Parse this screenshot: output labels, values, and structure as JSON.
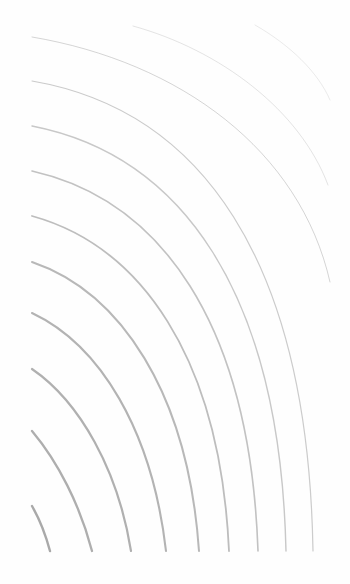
{
  "artwork": {
    "description": "Nested concentric curved lines radiating from the bottom-left corner",
    "background": "#fefefe",
    "line_color": "#9a9a9a",
    "curves": [
      {
        "d": "M32,506 C40,520 46,536 50,551",
        "width": 2.4,
        "opacity": 0.85
      },
      {
        "d": "M32,431 C58,462 80,505 92,551",
        "width": 2.3,
        "opacity": 0.8
      },
      {
        "d": "M32,369 C80,402 118,470 131,551",
        "width": 2.2,
        "opacity": 0.78
      },
      {
        "d": "M32,313 C100,345 152,430 166,551",
        "width": 2.1,
        "opacity": 0.75
      },
      {
        "d": "M32,262 C120,292 188,392 199,551",
        "width": 2.0,
        "opacity": 0.7
      },
      {
        "d": "M32,216 C140,246 220,356 229,551",
        "width": 1.8,
        "opacity": 0.65
      },
      {
        "d": "M32,171 C160,200 250,322 258,551",
        "width": 1.6,
        "opacity": 0.6
      },
      {
        "d": "M32,126 C180,155 280,290 286,551",
        "width": 1.4,
        "opacity": 0.55
      },
      {
        "d": "M32,81 C200,110 308,258 313,551",
        "width": 1.2,
        "opacity": 0.5
      },
      {
        "d": "M32,37 C180,62 300,150 330,282",
        "width": 1.0,
        "opacity": 0.42
      },
      {
        "d": "M133,26 C220,50 300,110 328,185",
        "width": 0.9,
        "opacity": 0.3
      },
      {
        "d": "M255,25 C290,45 318,72 330,100",
        "width": 0.8,
        "opacity": 0.25
      }
    ]
  }
}
